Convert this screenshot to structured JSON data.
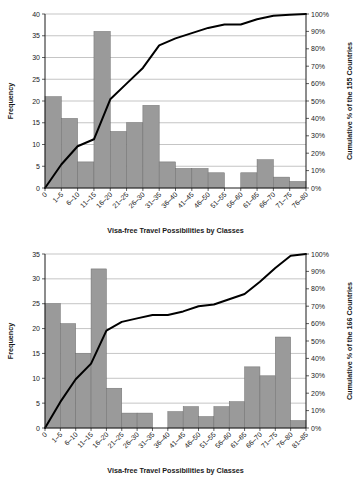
{
  "chart_data": [
    {
      "id": "top",
      "type": "bar",
      "title": "",
      "xlabel": "Visa-free Travel Possibilities by Classes",
      "ylabel": "Frequency",
      "y2label": "Cumulative % of the 155 Countries",
      "categories": [
        "0",
        "1–5",
        "6–10",
        "11–15",
        "16–20",
        "21–25",
        "26–30",
        "31–35",
        "36–40",
        "41–45",
        "46–50",
        "51–55",
        "56–60",
        "61–65",
        "66–70",
        "71–75",
        "76–80"
      ],
      "values": [
        0,
        21,
        16,
        6,
        36,
        13,
        15,
        19,
        6,
        4.5,
        4.5,
        3.5,
        0,
        3.5,
        6.5,
        2.5,
        1.5
      ],
      "cumulative_pct": [
        0,
        13.5,
        24,
        28,
        51,
        60,
        69,
        82,
        86,
        89,
        92,
        94,
        94,
        97,
        99,
        99.5,
        100
      ],
      "ylim": [
        0,
        40
      ],
      "yticks": [
        0,
        5,
        10,
        15,
        20,
        25,
        30,
        35,
        40
      ],
      "ytick_labels": [
        "0",
        "5",
        "10",
        "15",
        "20",
        "25",
        "30",
        "35",
        "40"
      ],
      "y2lim": [
        0,
        100
      ],
      "y2ticks": [
        0,
        10,
        20,
        30,
        40,
        50,
        60,
        70,
        80,
        90,
        100
      ],
      "y2tick_labels": [
        "0%",
        "10%",
        "20%",
        "30%",
        "40%",
        "50%",
        "60%",
        "70%",
        "80%",
        "90%",
        "100%"
      ],
      "grid": true,
      "legend": "none",
      "bar_color": "#9a9a9a",
      "line_color": "#000000"
    },
    {
      "id": "bottom",
      "type": "bar",
      "title": "",
      "xlabel": "Visa-free Travel Possibilities by Classes",
      "ylabel": "Frequency",
      "y2label": "Cumulative % of the 166 Countries",
      "categories": [
        "0",
        "1–5",
        "6–10",
        "11–15",
        "16–20",
        "21–25",
        "26–30",
        "31–35",
        "36–40",
        "41–45",
        "46–50",
        "51–55",
        "56–60",
        "61–65",
        "66–70",
        "71–75",
        "76–80",
        "81–85"
      ],
      "values": [
        0,
        25,
        21,
        15,
        32,
        8,
        3,
        3,
        0,
        3.3,
        4.3,
        2.3,
        4.3,
        5.3,
        12.3,
        10.5,
        18.3,
        1.5
      ],
      "cumulative_pct": [
        0,
        15,
        28,
        37,
        56,
        61,
        63,
        65,
        65,
        67,
        70,
        71,
        74,
        77,
        84,
        92,
        99,
        100
      ],
      "ylim": [
        0,
        35
      ],
      "yticks": [
        0,
        5,
        10,
        15,
        20,
        25,
        30,
        35
      ],
      "ytick_labels": [
        "0",
        "5",
        "10",
        "15",
        "20",
        "25",
        "30",
        "35"
      ],
      "y2lim": [
        0,
        100
      ],
      "y2ticks": [
        0,
        10,
        20,
        30,
        40,
        50,
        60,
        70,
        80,
        90,
        100
      ],
      "y2tick_labels": [
        "0%",
        "10%",
        "20%",
        "30%",
        "40%",
        "50%",
        "60%",
        "70%",
        "80%",
        "90%",
        "100%"
      ],
      "grid": true,
      "legend": "none",
      "bar_color": "#9a9a9a",
      "line_color": "#000000"
    }
  ]
}
